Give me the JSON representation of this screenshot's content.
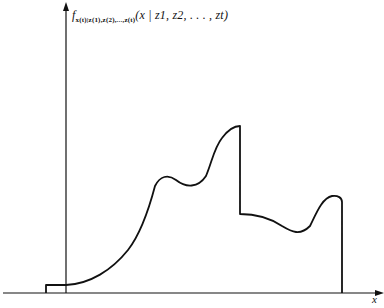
{
  "diagram": {
    "type": "probability-density-plot",
    "y_axis": {
      "label_function": "f",
      "label_subscript": "x(t)|z(1),z(2),...,z(t)",
      "label_args": "(x | z1, z2, . . . , zt)"
    },
    "x_axis": {
      "label": "x"
    },
    "curve": {
      "description": "Piecewise density with a small step near origin, rising curve with local bump, peak followed by vertical drop, a lower plateau with dip and final bump, then vertical drop to zero",
      "stroke_color": "#111111"
    }
  }
}
